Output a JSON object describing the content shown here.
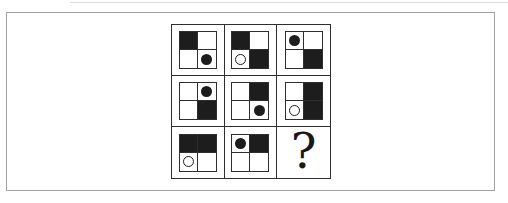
{
  "figure": {
    "type": "matrix-puzzle",
    "grid": {
      "rows": 3,
      "cols": 3,
      "cells": [
        {
          "id": "r1c1",
          "quadrants": {
            "tl": "black",
            "tr": "white",
            "bl": "white",
            "br": "white"
          },
          "circle": {
            "quadrant": "br",
            "style": "filled"
          }
        },
        {
          "id": "r1c2",
          "quadrants": {
            "tl": "black",
            "tr": "white",
            "bl": "white",
            "br": "black"
          },
          "circle": {
            "quadrant": "bl",
            "style": "outlined"
          }
        },
        {
          "id": "r1c3",
          "quadrants": {
            "tl": "white",
            "tr": "white",
            "bl": "white",
            "br": "black"
          },
          "circle": {
            "quadrant": "tl",
            "style": "filled"
          }
        },
        {
          "id": "r2c1",
          "quadrants": {
            "tl": "white",
            "tr": "white",
            "bl": "white",
            "br": "black"
          },
          "circle": {
            "quadrant": "tr",
            "style": "filled"
          }
        },
        {
          "id": "r2c2",
          "quadrants": {
            "tl": "white",
            "tr": "black",
            "bl": "white",
            "br": "white"
          },
          "circle": {
            "quadrant": "br",
            "style": "filled"
          }
        },
        {
          "id": "r2c3",
          "quadrants": {
            "tl": "white",
            "tr": "black",
            "bl": "white",
            "br": "black"
          },
          "circle": {
            "quadrant": "bl",
            "style": "outlined"
          }
        },
        {
          "id": "r3c1",
          "quadrants": {
            "tl": "black",
            "tr": "black",
            "bl": "white",
            "br": "white"
          },
          "circle": {
            "quadrant": "bl",
            "style": "outlined"
          }
        },
        {
          "id": "r3c2",
          "quadrants": {
            "tl": "white",
            "tr": "black",
            "bl": "white",
            "br": "white"
          },
          "circle": {
            "quadrant": "tl",
            "style": "filled"
          }
        },
        {
          "id": "r3c3",
          "unknown": true,
          "placeholder": "?"
        }
      ]
    },
    "colors": {
      "shape_black": "#1d1d1d",
      "grid_line": "#2e2e2e",
      "frame_gray": "#a0a0a0",
      "background": "#ffffff"
    }
  }
}
